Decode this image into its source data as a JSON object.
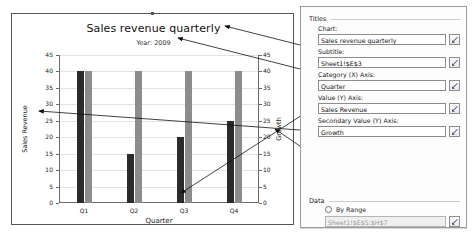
{
  "chart_pane": {
    "title": "Sales revenue quarterly",
    "subtitle": "Year: 2009",
    "xlabel": "Quarter",
    "ylabel_left": "Sales Revenue",
    "ylabel_right": "Growth"
  },
  "chart_data": {
    "type": "bar",
    "title": "Sales revenue quarterly",
    "subtitle": "Year: 2009",
    "xlabel": "Quarter",
    "ylabel": "Sales Revenue",
    "y2label": "Growth",
    "categories": [
      "Q1",
      "Q2",
      "Q3",
      "Q4"
    ],
    "series": [
      {
        "name": "Sales Revenue",
        "color": "#2b2b2b",
        "values": [
          40,
          15,
          20,
          25
        ]
      },
      {
        "name": "Growth",
        "color": "#8c8c8c",
        "values": [
          40,
          40,
          40,
          40
        ]
      }
    ],
    "ylim": [
      0,
      45
    ],
    "yticks": [
      0,
      5,
      10,
      15,
      20,
      25,
      30,
      35,
      40,
      45
    ],
    "y2lim": [
      0,
      45
    ],
    "y2ticks": [
      0,
      5,
      10,
      15,
      20,
      25,
      30,
      35,
      40,
      45
    ],
    "grid": true,
    "legend": "none"
  },
  "panel": {
    "titles_group": "Titles",
    "data_group": "Data",
    "fields": [
      {
        "label": "Chart:",
        "value": "Sales revenue quarterly",
        "icon": "range-picker-icon",
        "disabled": false
      },
      {
        "label": "Subtitle:",
        "value": "Sheet1!$E$3",
        "icon": "range-picker-icon",
        "disabled": false
      },
      {
        "label": "Category (X) Axis:",
        "value": "Quarter",
        "icon": "range-picker-icon",
        "disabled": false
      },
      {
        "label": "Value (Y) Axis:",
        "value": "Sales Revenue",
        "icon": "range-picker-icon",
        "disabled": false
      },
      {
        "label": "Secondary Value (Y) Axis:",
        "value": "Growth",
        "icon": "range-picker-icon",
        "disabled": false
      }
    ],
    "by_range": {
      "label": "By Range",
      "selected": false,
      "value": "Sheet1!$E$5:$H$7",
      "icon": "range-picker-icon",
      "disabled": true
    }
  }
}
